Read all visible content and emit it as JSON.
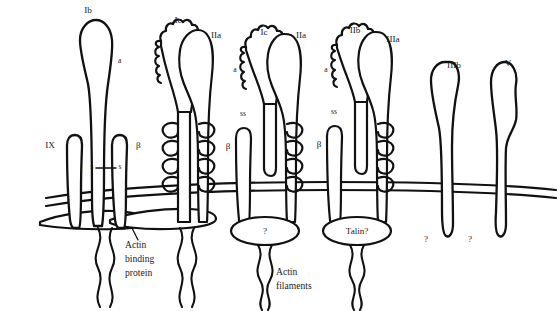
{
  "figure": {
    "background_color": "#ffffff",
    "line_color": "#111111",
    "text_color": "#1a1a1a"
  },
  "labels": {
    "gp_ib": "Ib",
    "gp_ib_alpha": "a",
    "gp_ix": "IX",
    "gp_ib_beta": "β",
    "disulfide_left_s": "s",
    "disulfide_right_s": "s",
    "gp_ic_1": "Ic",
    "gp_iia_1": "IIa",
    "gp_ic_2": "Ic",
    "gp_iia_2": "IIa",
    "alpha_2": "a",
    "ss_2": "ss",
    "beta_2": "β",
    "gp_iib": "IIb",
    "gp_iiia": "IIIa",
    "alpha_3": "a",
    "ss_3": "ss",
    "beta_3": "β",
    "gp_iiib": "IIIb",
    "gp_v": "V",
    "actin_binding_protein_line1": "Actin",
    "actin_binding_protein_line2": "binding",
    "actin_binding_protein_line3": "protein",
    "actin_filaments_line1": "Actin",
    "actin_filaments_line2": "filaments",
    "unknown_anchor_1": "?",
    "talin_anchor": "Talin?",
    "unknown_tail_iiib": "?",
    "unknown_tail_v": "?"
  },
  "structures": [
    {
      "name": "gpib-ix-v-complex",
      "subunits": [
        "Ib",
        "a",
        "IX",
        "β"
      ],
      "anchor": "Actin binding protein"
    },
    {
      "name": "gpic-iia-integrin-1",
      "subunits": [
        "Ic",
        "IIa"
      ],
      "anchor": "Actin binding protein"
    },
    {
      "name": "gpic-iia-integrin-2",
      "subunits": [
        "Ic",
        "IIa",
        "a",
        "ss",
        "β"
      ],
      "anchor": "?"
    },
    {
      "name": "gpiib-iiia-integrin",
      "subunits": [
        "IIb",
        "IIIa",
        "a",
        "ss",
        "β"
      ],
      "anchor": "Talin?"
    },
    {
      "name": "gpiiib-receptor",
      "subunits": [
        "IIIb"
      ],
      "anchor": "?"
    },
    {
      "name": "gpv-receptor",
      "subunits": [
        "V"
      ],
      "anchor": "?"
    }
  ]
}
